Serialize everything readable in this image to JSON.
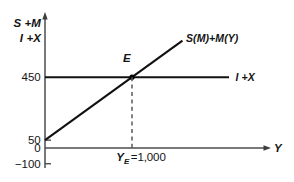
{
  "chart_data": {
    "type": "line",
    "title": "",
    "xlabel": "Y",
    "ylabel_line1": "S +M",
    "ylabel_line2": "I +X",
    "grid": false,
    "legend": "inline-end-labels",
    "x_axis": {
      "range": [
        0,
        2600
      ],
      "ticks": [
        {
          "value": 1000,
          "label": "Y_E =1,000",
          "variable": "Y",
          "subscript": "E",
          "rest": "=1,000"
        }
      ]
    },
    "y_axis": {
      "range": [
        -100,
        570
      ],
      "ticks": [
        {
          "value": 450,
          "label": "450",
          "tick_mark": false
        },
        {
          "value": 50,
          "label": "50",
          "tick_mark": true
        },
        {
          "value": 0,
          "label": "0",
          "tick_mark": false
        },
        {
          "value": -100,
          "label": "−100",
          "tick_mark": true
        }
      ]
    },
    "series": [
      {
        "name": "savings-imports",
        "label": "S(M)+M(Y)",
        "intercept": 50,
        "slope": 0.4,
        "points": [
          [
            0,
            50
          ],
          [
            1580,
            682
          ]
        ],
        "label_at": [
          1620,
          700
        ]
      },
      {
        "name": "investment-exports",
        "label": "I +X",
        "constant": 450,
        "points": [
          [
            0,
            450
          ],
          [
            2115,
            450
          ]
        ],
        "label_at": [
          2190,
          450
        ]
      }
    ],
    "annotations": [
      {
        "name": "equilibrium-point",
        "label": "E",
        "x": 1000,
        "y": 450,
        "label_at": [
          940,
          545
        ]
      },
      {
        "name": "equilibrium-guide",
        "from": [
          1000,
          450
        ],
        "to": [
          1000,
          0
        ]
      }
    ],
    "colors": {
      "curve": "#111111",
      "axis": "#4d4d4d",
      "guide": "#5a5a5a",
      "background": "#ffffff"
    }
  }
}
